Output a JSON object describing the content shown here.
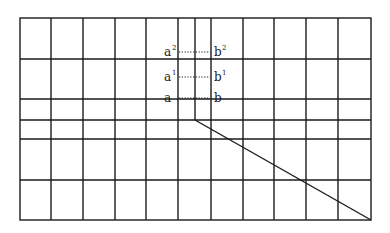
{
  "diagram": {
    "type": "grid-with-projection",
    "stroke_color": "#1a1a1a",
    "background": "#ffffff",
    "frame": {
      "x1": 20,
      "y1": 18,
      "x2": 371,
      "y2": 220
    },
    "vertical_lines_x": [
      51,
      83,
      115,
      146,
      178,
      211,
      243,
      274,
      306,
      338
    ],
    "center_vertical_line": {
      "x": 195,
      "y1": 18,
      "y2": 120
    },
    "horizontal_lines_y": [
      59,
      99,
      120,
      139,
      180
    ],
    "diagonal_line": {
      "x1": 195,
      "y1": 120,
      "x2": 371,
      "y2": 220
    },
    "dotted_connectors": [
      {
        "y": 52,
        "x1": 179,
        "x2": 210
      },
      {
        "y": 77,
        "x1": 179,
        "x2": 210
      },
      {
        "y": 98,
        "x1": 179,
        "x2": 210
      }
    ],
    "labels": {
      "left": [
        {
          "base": "a",
          "sup": "2",
          "x": 164,
          "y": 56
        },
        {
          "base": "a",
          "sup": "1",
          "x": 164,
          "y": 81
        },
        {
          "base": "a",
          "sup": "",
          "x": 164,
          "y": 102
        }
      ],
      "right": [
        {
          "base": "b",
          "sup": "2",
          "x": 214,
          "y": 56
        },
        {
          "base": "b",
          "sup": "1",
          "x": 214,
          "y": 81
        },
        {
          "base": "b",
          "sup": "",
          "x": 214,
          "y": 102
        }
      ]
    }
  }
}
